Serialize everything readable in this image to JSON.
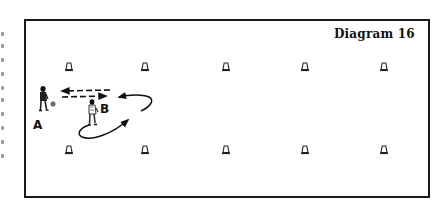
{
  "diagram": {
    "title": "Diagram 16",
    "players": [
      {
        "id": "A",
        "label": "A",
        "role": "player with ball"
      },
      {
        "id": "B",
        "label": "B",
        "role": "receiving player"
      }
    ],
    "cones": {
      "top_row_count": 5,
      "bottom_row_count": 5
    },
    "arrows": [
      {
        "type": "dashed",
        "direction": "left",
        "meaning": "pass"
      },
      {
        "type": "dashed",
        "direction": "right",
        "meaning": "pass"
      },
      {
        "type": "curved-solid",
        "meaning": "run"
      },
      {
        "type": "curved-solid",
        "meaning": "run"
      }
    ],
    "colors": {
      "ink": "#111111",
      "paper": "#ffffff",
      "frame": "#1a1a1a"
    }
  }
}
